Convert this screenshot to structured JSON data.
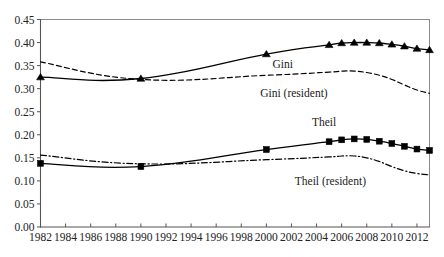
{
  "chart_data": {
    "type": "line",
    "title": "",
    "subtitle": "",
    "xlabel": "",
    "ylabel": "",
    "xlim": [
      1982,
      2013
    ],
    "ylim": [
      0.0,
      0.45
    ],
    "grid": false,
    "legend_position": "inline-annotations",
    "x_ticks": [
      1982,
      1984,
      1986,
      1988,
      1990,
      1992,
      1994,
      1996,
      1998,
      2000,
      2002,
      2004,
      2006,
      2008,
      2010,
      2012
    ],
    "x_tick_labels": [
      "1982",
      "1984",
      "1986",
      "1988",
      "1990",
      "1992",
      "1994",
      "1996",
      "1998",
      "2000",
      "2002",
      "2004",
      "2006",
      "2008",
      "2010",
      "2012"
    ],
    "y_ticks": [
      0.0,
      0.05,
      0.1,
      0.15,
      0.2,
      0.25,
      0.3,
      0.35,
      0.4,
      0.45
    ],
    "y_tick_labels": [
      "0.00",
      "0.05",
      "0.10",
      "0.15",
      "0.20",
      "0.25",
      "0.30",
      "0.35",
      "0.40",
      "0.45"
    ],
    "series": [
      {
        "name": "Gini",
        "label": "Gini",
        "style": "solid",
        "marker": "triangle",
        "color": "#000000",
        "label_x": 2001.3,
        "label_y": 0.345,
        "x": [
          1982,
          1990,
          2000,
          2005,
          2006,
          2007,
          2008,
          2009,
          2010,
          2011,
          2012,
          2013
        ],
        "values": [
          0.325,
          0.322,
          0.375,
          0.395,
          0.399,
          0.4,
          0.4,
          0.399,
          0.396,
          0.392,
          0.387,
          0.384
        ]
      },
      {
        "name": "Gini (resident)",
        "label": "Gini (resident)",
        "style": "dashed",
        "marker": "none",
        "color": "#000000",
        "label_x": 2002.2,
        "label_y": 0.282,
        "x": [
          1982,
          1990,
          2000,
          2005,
          2006,
          2007,
          2008,
          2009,
          2010,
          2011,
          2012,
          2013
        ],
        "values": [
          0.358,
          0.32,
          0.329,
          0.336,
          0.338,
          0.338,
          0.335,
          0.329,
          0.32,
          0.308,
          0.297,
          0.29
        ]
      },
      {
        "name": "Theil",
        "label": "Theil",
        "style": "solid",
        "marker": "square",
        "color": "#000000",
        "label_x": 2004.6,
        "label_y": 0.218,
        "x": [
          1982,
          1990,
          2000,
          2005,
          2006,
          2007,
          2008,
          2009,
          2010,
          2011,
          2012,
          2013
        ],
        "values": [
          0.138,
          0.131,
          0.168,
          0.185,
          0.189,
          0.191,
          0.19,
          0.186,
          0.181,
          0.175,
          0.169,
          0.166
        ]
      },
      {
        "name": "Theil (resident)",
        "label": "Theil (resident)",
        "style": "dashdot",
        "marker": "none",
        "color": "#000000",
        "label_x": 2005.1,
        "label_y": 0.092,
        "x": [
          1982,
          1990,
          2000,
          2005,
          2006,
          2007,
          2008,
          2009,
          2010,
          2011,
          2012,
          2013
        ],
        "values": [
          0.156,
          0.137,
          0.146,
          0.152,
          0.154,
          0.154,
          0.15,
          0.142,
          0.131,
          0.122,
          0.116,
          0.113
        ]
      }
    ]
  }
}
